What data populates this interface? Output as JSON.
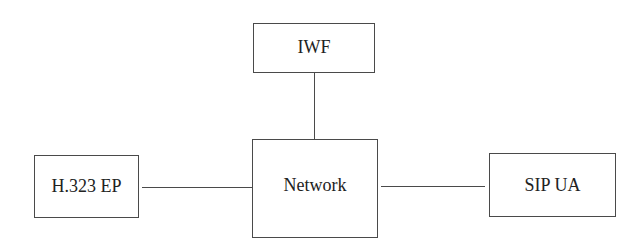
{
  "diagram": {
    "nodes": [
      {
        "id": "iwf",
        "label": "IWF"
      },
      {
        "id": "network",
        "label": "Network"
      },
      {
        "id": "h323_ep",
        "label": "H.323 EP"
      },
      {
        "id": "sip_ua",
        "label": "SIP UA"
      }
    ],
    "edges": [
      {
        "from": "iwf",
        "to": "network"
      },
      {
        "from": "h323_ep",
        "to": "network"
      },
      {
        "from": "network",
        "to": "sip_ua"
      }
    ],
    "colors": {
      "stroke": "#4a4a4a",
      "text": "#222222",
      "background": "#ffffff"
    }
  }
}
